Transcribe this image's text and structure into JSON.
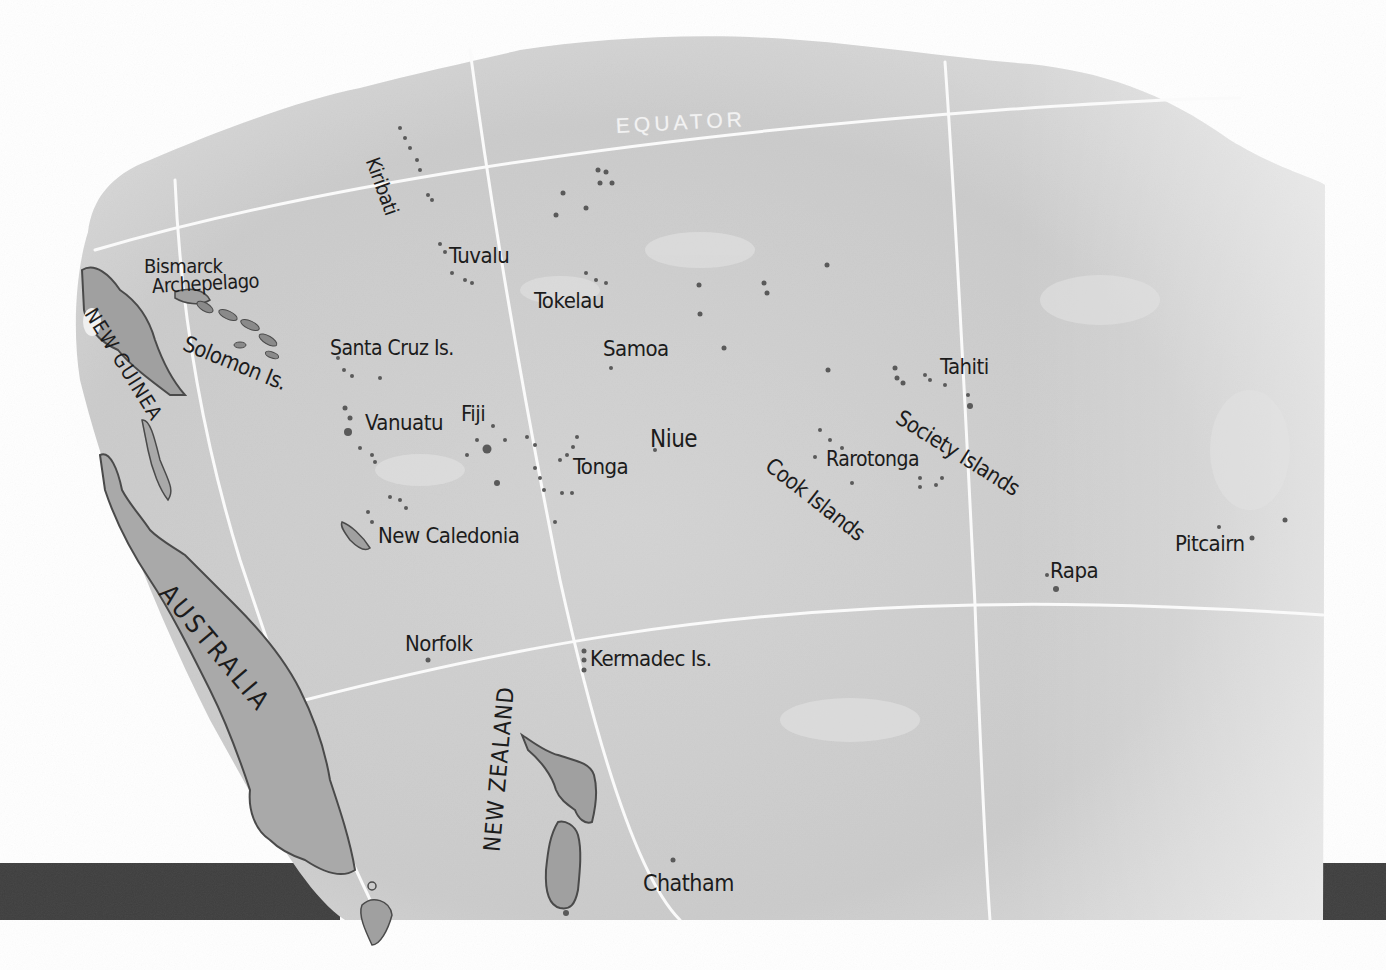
{
  "map": {
    "title": "Pacific Islands",
    "colors": {
      "ocean": "#cfcfcf",
      "ocean_light": "#e6e6e6",
      "land": "#a9a9a9",
      "coast": "#4a4a4a",
      "grid": "#fafafa",
      "band": "#3e3e3e",
      "ink": "#1c1c1c"
    },
    "gridline_label": "EQUATOR",
    "landmasses": {
      "new_guinea": "NEW GUINEA",
      "australia": "AUSTRALIA",
      "new_zealand": "NEW ZEALAND"
    },
    "labels": {
      "bismarck_1": "Bismarck",
      "bismarck_2": "Archepelago",
      "solomon": "Solomon Is.",
      "kiribati": "Kiribati",
      "tuvalu": "Tuvalu",
      "tokelau": "Tokelau",
      "santa_cruz": "Santa Cruz Is.",
      "samoa": "Samoa",
      "vanuatu": "Vanuatu",
      "fiji": "Fiji",
      "tonga": "Tonga",
      "niue": "Niue",
      "new_caledonia": "New Caledonia",
      "tahiti": "Tahiti",
      "society": "Society Islands",
      "rarotonga": "Rarotonga",
      "cook": "Cook Islands",
      "rapa": "Rapa",
      "pitcairn": "Pitcairn",
      "norfolk": "Norfolk",
      "kermadec": "Kermadec Is.",
      "chatham": "Chatham"
    }
  }
}
